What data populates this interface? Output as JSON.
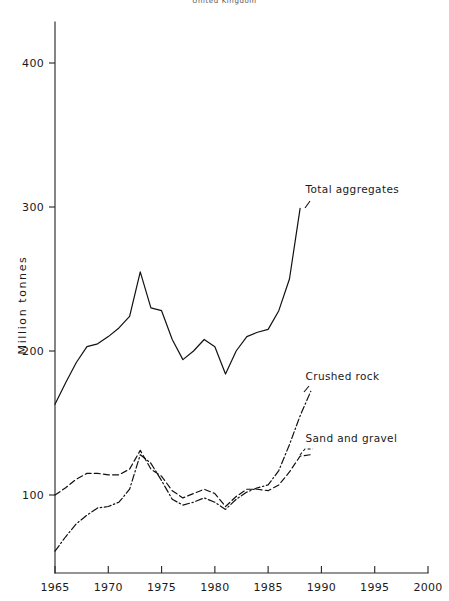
{
  "figure": {
    "title": "United Kingdom",
    "background_color": "#ffffff",
    "line_color": "#111111"
  },
  "chart_data": {
    "type": "line",
    "title": "United Kingdom",
    "subtitle": "",
    "xlabel": "",
    "ylabel": "Million tonnes",
    "xlim": [
      1965,
      2000
    ],
    "ylim": [
      0,
      440
    ],
    "xticks": [
      1965,
      1970,
      1975,
      1980,
      1985,
      1990,
      1995,
      2000
    ],
    "xtick_labels": [
      "1965",
      "1970",
      "1975",
      "1980",
      "1985",
      "1990",
      "1995",
      "2000"
    ],
    "yticks": [
      100,
      200,
      300,
      400
    ],
    "ytick_labels": [
      "100",
      "200",
      "300",
      "400"
    ],
    "grid": false,
    "legend_position": "inline-annotations",
    "annotations": [
      {
        "text": "Total aggregates",
        "x": 1988.5,
        "y": 310
      },
      {
        "text": "Crushed rock",
        "x": 1988.5,
        "y": 180
      },
      {
        "text": "Sand and gravel",
        "x": 1988.5,
        "y": 137
      }
    ],
    "series": [
      {
        "name": "Total aggregates",
        "style": "solid",
        "x": [
          1965,
          1966,
          1967,
          1968,
          1969,
          1970,
          1971,
          1972,
          1973,
          1974,
          1975,
          1976,
          1977,
          1978,
          1979,
          1980,
          1981,
          1982,
          1983,
          1984,
          1985,
          1986,
          1987,
          1988
        ],
        "values": [
          163,
          178,
          192,
          203,
          205,
          210,
          216,
          224,
          255,
          230,
          228,
          208,
          194,
          200,
          208,
          203,
          184,
          200,
          210,
          213,
          215,
          228,
          250,
          299
        ]
      },
      {
        "name": "Sand and gravel",
        "style": "dashed",
        "x": [
          1965,
          1966,
          1967,
          1968,
          1969,
          1970,
          1971,
          1972,
          1973,
          1974,
          1975,
          1976,
          1977,
          1978,
          1979,
          1980,
          1981,
          1982,
          1983,
          1984,
          1985,
          1986,
          1987,
          1988,
          1989
        ],
        "values": [
          100,
          105,
          111,
          115,
          115,
          114,
          114,
          118,
          131,
          118,
          113,
          103,
          98,
          101,
          104,
          101,
          92,
          99,
          104,
          104,
          103,
          107,
          116,
          127,
          128
        ]
      },
      {
        "name": "Crushed rock",
        "style": "dashdot",
        "x": [
          1965,
          1966,
          1967,
          1968,
          1969,
          1970,
          1971,
          1972,
          1973,
          1974,
          1975,
          1976,
          1977,
          1978,
          1979,
          1980,
          1981,
          1982,
          1983,
          1984,
          1985,
          1986,
          1987,
          1988,
          1989
        ],
        "values": [
          61,
          71,
          80,
          86,
          91,
          92,
          95,
          104,
          128,
          122,
          110,
          97,
          93,
          95,
          98,
          95,
          90,
          97,
          102,
          105,
          107,
          117,
          135,
          155,
          172
        ]
      }
    ]
  }
}
